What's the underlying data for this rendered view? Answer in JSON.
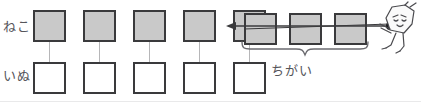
{
  "diagram": {
    "type": "comparison-bar-model",
    "rows": [
      {
        "id": "top-row",
        "label": "ねこ",
        "label_reading": "neko",
        "cell_count": 8,
        "cell_fill": "#c9c9c9",
        "cell_border": "#3a3a3c"
      },
      {
        "id": "bottom-row",
        "label": "いぬ",
        "label_reading": "inu",
        "cell_count": 5,
        "cell_fill": "#ffffff",
        "cell_border": "#3a3a3c"
      }
    ],
    "top_row_cells": [
      {
        "index": 1,
        "x": 33,
        "y": 10,
        "fill": "gray",
        "paired": true
      },
      {
        "index": 2,
        "x": 83,
        "y": 10,
        "fill": "gray",
        "paired": true
      },
      {
        "index": 3,
        "x": 133,
        "y": 10,
        "fill": "gray",
        "paired": true
      },
      {
        "index": 4,
        "x": 183,
        "y": 10,
        "fill": "gray",
        "paired": true
      },
      {
        "index": 5,
        "x": 233,
        "y": 10,
        "fill": "gray",
        "paired": true
      },
      {
        "index": 6,
        "x": 244,
        "y": 13,
        "fill": "gray",
        "paired": false
      },
      {
        "index": 7,
        "x": 289,
        "y": 13,
        "fill": "gray",
        "paired": false
      },
      {
        "index": 8,
        "x": 334,
        "y": 13,
        "fill": "gray",
        "paired": false
      }
    ],
    "bottom_row_cells": [
      {
        "index": 1,
        "x": 33,
        "y": 62,
        "fill": "white"
      },
      {
        "index": 2,
        "x": 83,
        "y": 62,
        "fill": "white"
      },
      {
        "index": 3,
        "x": 133,
        "y": 62,
        "fill": "white"
      },
      {
        "index": 4,
        "x": 183,
        "y": 62,
        "fill": "white"
      },
      {
        "index": 5,
        "x": 233,
        "y": 62,
        "fill": "white"
      }
    ],
    "connectors": [
      {
        "x": 49,
        "y_top": 42,
        "y_bottom": 62
      },
      {
        "x": 99,
        "y_top": 42,
        "y_bottom": 62
      },
      {
        "x": 149,
        "y_top": 42,
        "y_bottom": 62
      },
      {
        "x": 199,
        "y_top": 42,
        "y_bottom": 62
      },
      {
        "x": 249,
        "y_top": 42,
        "y_bottom": 62
      }
    ],
    "brace": {
      "label": "ちがい",
      "label_reading": "chigai",
      "span_from_x": 240,
      "span_to_x": 368,
      "stroke": "#6b6b70"
    },
    "pull_arrow": {
      "direction": "left",
      "from_x": 392,
      "to_x": 228,
      "stroke": "#3a3a3c"
    },
    "mascot": {
      "name": "pulling-character",
      "description": "cartoon figure tugging the difference segment",
      "stroke": "#4a4a4e"
    }
  },
  "colors": {
    "gray_fill": "#c9c9c9",
    "outline": "#3a3a3c",
    "text": "#55555a",
    "connector": "#b6b6b8",
    "rule": "#e9e9ea"
  }
}
